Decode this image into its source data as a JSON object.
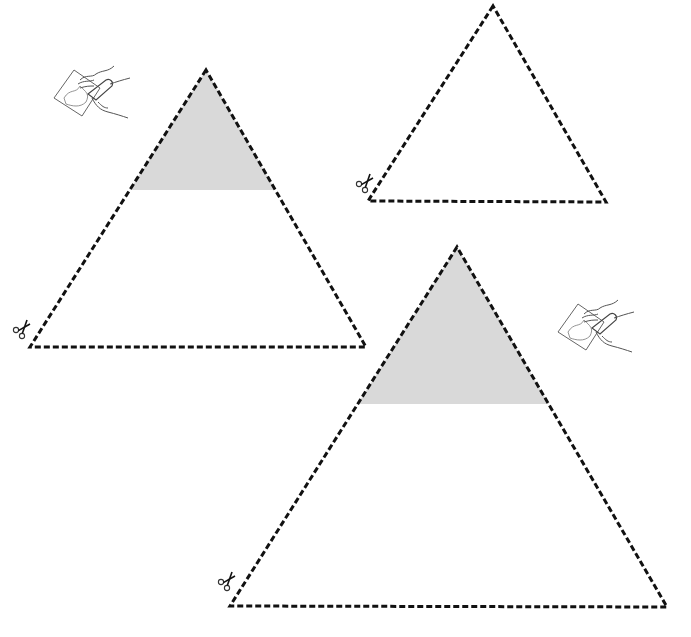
{
  "worksheet": {
    "title": "Triangle cut-and-paste activity",
    "colors": {
      "background": "#ffffff",
      "dashed_line": "#111111",
      "shaded_fill": "#d9d9d9",
      "icon_stroke": "#555555"
    },
    "triangles": [
      {
        "id": "triangle-1",
        "apex": [
          206,
          70
        ],
        "bottom_left": [
          30,
          347
        ],
        "bottom_right": [
          366,
          347
        ],
        "shaded_top_to_y": 190,
        "shaded": true,
        "cut_icon": "scissors-icon",
        "glue_icon": "glue-hand-icon"
      },
      {
        "id": "triangle-2",
        "apex": [
          493,
          6
        ],
        "bottom_left": [
          368,
          201
        ],
        "bottom_right": [
          606,
          202
        ],
        "shaded": false,
        "cut_icon": "scissors-icon"
      },
      {
        "id": "triangle-3",
        "apex": [
          457,
          247
        ],
        "bottom_left": [
          230,
          606
        ],
        "bottom_right": [
          667,
          607
        ],
        "shaded_top_to_y": 404,
        "shaded": true,
        "cut_icon": "scissors-icon",
        "glue_icon": "glue-hand-icon"
      }
    ],
    "icons": {
      "scissors": "scissors-icon",
      "glue": "glue-hand-icon"
    }
  }
}
